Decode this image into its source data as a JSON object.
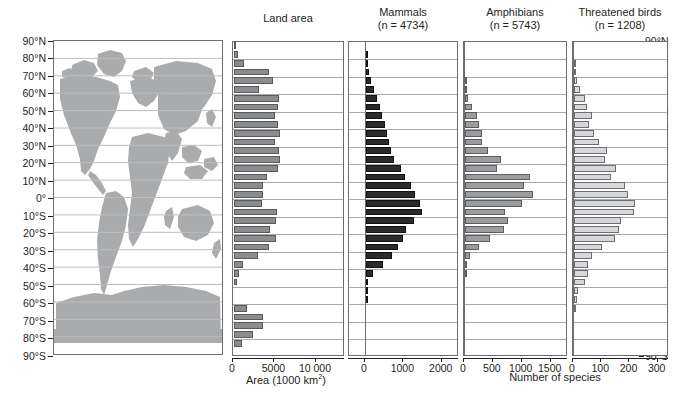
{
  "figure": {
    "panels": [
      "Land area",
      "Mammals",
      "Amphibians",
      "Threatened birds"
    ]
  },
  "map": {
    "name": "world-map",
    "land_color": "#a9abad",
    "background": "#ffffff"
  },
  "latitude_axis": {
    "labels": [
      "90°N",
      "80°N",
      "70°N",
      "60°N",
      "50°N",
      "40°N",
      "30°N",
      "20°N",
      "10°N",
      "0°",
      "10°S",
      "20°S",
      "30°S",
      "40°S",
      "50°S",
      "60°S",
      "70°S",
      "80°S",
      "90°S"
    ],
    "values": [
      90,
      80,
      70,
      60,
      50,
      40,
      30,
      20,
      10,
      0,
      -10,
      -20,
      -30,
      -40,
      -50,
      -60,
      -70,
      -80,
      -90
    ]
  },
  "chart_data": [
    {
      "type": "bar",
      "title": "Land area",
      "subtitle": "",
      "orientation": "horizontal",
      "xlabel": "Area (1000 km2)",
      "xlabel_rich": "Area (1000 km²)",
      "ylabel": "Latitude",
      "xlim": [
        0,
        13500
      ],
      "xticks": [
        0,
        5000,
        10000
      ],
      "xticklabels": [
        "0",
        "5000",
        "10 000"
      ],
      "bar_color": "#8a8c8e",
      "grid": true,
      "bands": [
        "90-85N",
        "85-80N",
        "80-75N",
        "75-70N",
        "70-65N",
        "65-60N",
        "60-55N",
        "55-50N",
        "50-45N",
        "45-40N",
        "40-35N",
        "35-30N",
        "30-25N",
        "25-20N",
        "20-15N",
        "15-10N",
        "10-5N",
        "5-0N",
        "0-5S",
        "5-10S",
        "10-15S",
        "15-20S",
        "20-25S",
        "25-30S",
        "30-35S",
        "35-40S",
        "40-45S",
        "45-50S",
        "50-55S",
        "55-60S",
        "60-65S",
        "65-70S",
        "70-75S",
        "75-80S",
        "80-85S",
        "85-90S"
      ],
      "values": [
        120,
        480,
        1180,
        4200,
        4700,
        3000,
        5400,
        5300,
        5000,
        5250,
        5600,
        5000,
        5450,
        5500,
        5300,
        4000,
        3500,
        3500,
        3350,
        5150,
        5100,
        4300,
        5050,
        4200,
        2900,
        1100,
        600,
        320,
        0,
        0,
        1600,
        3550,
        3500,
        2300,
        950,
        0
      ]
    },
    {
      "type": "bar",
      "title": "Mammals",
      "subtitle": "(n = 4734)",
      "n": 4734,
      "orientation": "horizontal",
      "xlabel": "Number of species",
      "xlim": [
        0,
        2450
      ],
      "xticks": [
        0,
        1000,
        2000
      ],
      "xticklabels": [
        "0",
        "1000",
        "2000"
      ],
      "bar_color": "#2b2b2b",
      "grid": true,
      "bands": [
        "90-85N",
        "85-80N",
        "80-75N",
        "75-70N",
        "70-65N",
        "65-60N",
        "60-55N",
        "55-50N",
        "50-45N",
        "45-40N",
        "40-35N",
        "35-30N",
        "30-25N",
        "25-20N",
        "20-15N",
        "15-10N",
        "10-5N",
        "5-0N",
        "0-5S",
        "5-10S",
        "10-15S",
        "15-20S",
        "20-25S",
        "25-30S",
        "30-35S",
        "35-40S",
        "40-45S",
        "45-50S",
        "50-55S",
        "55-60S",
        "60-65S",
        "65-70S",
        "70-75S",
        "75-80S",
        "80-85S",
        "85-90S"
      ],
      "values": [
        0,
        20,
        55,
        90,
        140,
        210,
        290,
        360,
        420,
        500,
        560,
        600,
        660,
        720,
        900,
        1010,
        1180,
        1280,
        1400,
        1460,
        1260,
        1040,
        960,
        830,
        690,
        440,
        180,
        60,
        35,
        12,
        0,
        0,
        0,
        0,
        0,
        0
      ]
    },
    {
      "type": "bar",
      "title": "Amphibians",
      "subtitle": "(n = 5743)",
      "n": 5743,
      "orientation": "horizontal",
      "xlabel": "Number of species",
      "xlim": [
        0,
        1800
      ],
      "xticks": [
        0,
        500,
        1000,
        1500
      ],
      "xticklabels": [
        "0",
        "500",
        "1000",
        "1500"
      ],
      "bar_color": "#9a9c9e",
      "grid": true,
      "bands": [
        "90-85N",
        "85-80N",
        "80-75N",
        "75-70N",
        "70-65N",
        "65-60N",
        "60-55N",
        "55-50N",
        "50-45N",
        "45-40N",
        "40-35N",
        "35-30N",
        "30-25N",
        "25-20N",
        "20-15N",
        "15-10N",
        "10-5N",
        "5-0N",
        "0-5S",
        "5-10S",
        "10-15S",
        "15-20S",
        "20-25S",
        "25-30S",
        "30-35S",
        "35-40S",
        "40-45S",
        "45-50S",
        "50-55S",
        "55-60S",
        "60-65S",
        "65-70S",
        "70-75S",
        "75-80S",
        "80-85S",
        "85-90S"
      ],
      "values": [
        0,
        0,
        0,
        0,
        10,
        30,
        60,
        120,
        200,
        250,
        300,
        300,
        400,
        620,
        560,
        1130,
        1020,
        1180,
        980,
        700,
        740,
        680,
        430,
        250,
        90,
        20,
        8,
        0,
        0,
        0,
        0,
        0,
        0,
        0,
        0,
        0
      ]
    },
    {
      "type": "bar",
      "title": "Threatened birds",
      "subtitle": "(n = 1208)",
      "n": 1208,
      "orientation": "horizontal",
      "xlabel": "Number of species",
      "xlim": [
        0,
        340
      ],
      "xticks": [
        0,
        100,
        200,
        300
      ],
      "xticklabels": [
        "0",
        "100",
        "200",
        "300"
      ],
      "bar_color": "#d6d7d8",
      "grid": true,
      "bands": [
        "90-85N",
        "85-80N",
        "80-75N",
        "75-70N",
        "70-65N",
        "65-60N",
        "60-55N",
        "55-50N",
        "50-45N",
        "45-40N",
        "40-35N",
        "35-30N",
        "30-25N",
        "25-20N",
        "20-15N",
        "15-10N",
        "10-5N",
        "5-0N",
        "0-5S",
        "5-10S",
        "10-15S",
        "15-20S",
        "20-25S",
        "25-30S",
        "30-35S",
        "35-40S",
        "40-45S",
        "45-50S",
        "50-55S",
        "55-60S",
        "60-65S",
        "65-70S",
        "70-75S",
        "75-80S",
        "80-85S",
        "85-90S"
      ],
      "values": [
        0,
        0,
        5,
        8,
        12,
        20,
        38,
        45,
        62,
        52,
        72,
        88,
        118,
        110,
        148,
        132,
        180,
        190,
        215,
        212,
        165,
        158,
        145,
        100,
        62,
        50,
        50,
        38,
        15,
        10,
        6,
        0,
        0,
        0,
        0,
        0
      ]
    }
  ],
  "axis_titles": {
    "left": "Area (1000 km",
    "left_sup": "2",
    "left_tail": ")",
    "right": "Number of species"
  }
}
